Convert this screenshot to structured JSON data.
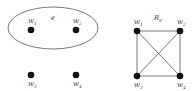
{
  "left_graph": {
    "hyperedge_label": "e",
    "nodes": [
      {
        "label": "w",
        "sub": "1"
      },
      {
        "label": "w",
        "sub": "2"
      },
      {
        "label": "w",
        "sub": "3"
      },
      {
        "label": "w",
        "sub": "4"
      }
    ]
  },
  "right_graph": {
    "title": "R",
    "title_sub": "e",
    "nodes": [
      {
        "label": "w",
        "sub": "1"
      },
      {
        "label": "w",
        "sub": "2"
      },
      {
        "label": "w",
        "sub": "3"
      },
      {
        "label": "w",
        "sub": "4"
      }
    ],
    "edges": [
      [
        "w1",
        "w2"
      ],
      [
        "w1",
        "w3"
      ],
      [
        "w1",
        "w4"
      ],
      [
        "w2",
        "w3"
      ],
      [
        "w2",
        "w4"
      ],
      [
        "w3",
        "w4"
      ]
    ]
  },
  "colors": {
    "node": "#111111",
    "edge": "#555555",
    "ellipse": "#555555"
  }
}
